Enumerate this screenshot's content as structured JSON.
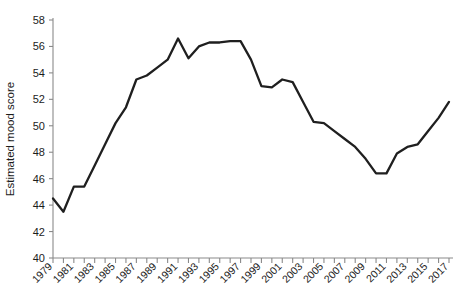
{
  "chart_data": {
    "type": "line",
    "title": "",
    "xlabel": "",
    "ylabel": "Estimated mood score",
    "xlim": [
      1979,
      2017
    ],
    "ylim": [
      40,
      58
    ],
    "ytick_step": 2,
    "xtick_step_major": 2,
    "xtick_step_minor": 1,
    "grid": false,
    "legend": "none",
    "line_color": "#1f1f1f",
    "axis_color": "#8a8a8a",
    "text_color": "#1c1c1c",
    "background": "#ffffff",
    "yticks": [
      40,
      42,
      44,
      46,
      48,
      50,
      52,
      54,
      56,
      58
    ],
    "ytick_labels": [
      "40",
      "42",
      "44",
      "46",
      "48",
      "50",
      "52",
      "54",
      "56",
      "58"
    ],
    "xticks": [
      1979,
      1981,
      1983,
      1985,
      1987,
      1989,
      1991,
      1993,
      1995,
      1997,
      1999,
      2001,
      2003,
      2005,
      2007,
      2009,
      2011,
      2013,
      2015,
      2017
    ],
    "xtick_labels": [
      "1979",
      "1981",
      "1983",
      "1985",
      "1987",
      "1989",
      "1991",
      "1993",
      "1995",
      "1997",
      "1999",
      "2001",
      "2003",
      "2005",
      "2007",
      "2009",
      "2011",
      "2013",
      "2015",
      "2017"
    ],
    "x": [
      1979,
      1980,
      1981,
      1982,
      1983,
      1984,
      1985,
      1986,
      1987,
      1988,
      1989,
      1990,
      1991,
      1992,
      1993,
      1994,
      1995,
      1996,
      1997,
      1998,
      1999,
      2000,
      2001,
      2002,
      2003,
      2004,
      2005,
      2006,
      2007,
      2008,
      2009,
      2010,
      2011,
      2012,
      2013,
      2014,
      2015,
      2016,
      2017
    ],
    "series": [
      {
        "name": "Estimated mood score",
        "values": [
          44.5,
          43.5,
          45.4,
          45.4,
          47.0,
          48.6,
          50.2,
          51.4,
          53.5,
          53.8,
          54.4,
          55.0,
          56.6,
          55.1,
          56.0,
          56.3,
          56.3,
          56.4,
          56.4,
          55.0,
          53.0,
          52.9,
          53.5,
          53.3,
          51.8,
          50.3,
          50.2,
          49.6,
          49.0,
          48.4,
          47.5,
          46.4,
          46.4,
          47.9,
          48.4,
          48.6,
          49.6,
          50.6,
          51.8
        ]
      }
    ]
  }
}
